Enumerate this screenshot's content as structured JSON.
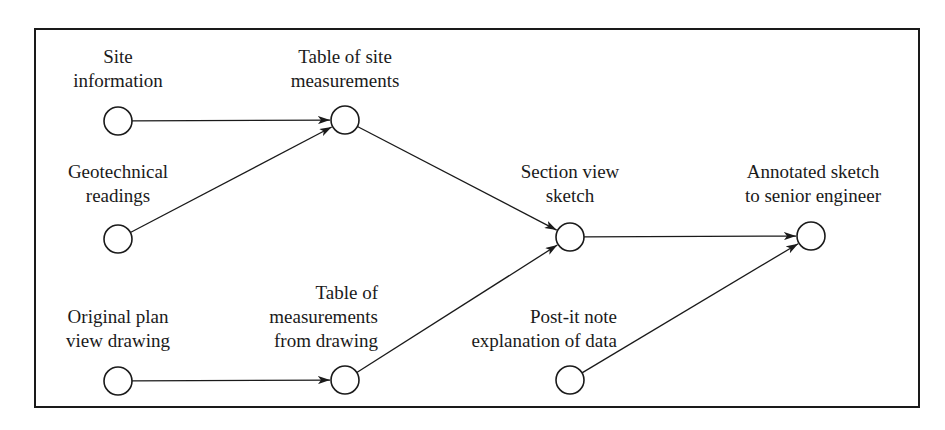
{
  "diagram": {
    "colors": {
      "stroke": "#1a1a1a",
      "background": "#ffffff"
    },
    "nodes": [
      {
        "id": "site_information",
        "label": [
          "Site",
          "information"
        ],
        "cx": 118,
        "cy": 121
      },
      {
        "id": "geotechnical_readings",
        "label": [
          "Geotechnical",
          "readings"
        ],
        "cx": 118,
        "cy": 239
      },
      {
        "id": "original_plan_view_drawing",
        "label": [
          "Original plan",
          "view drawing"
        ],
        "cx": 118,
        "cy": 381
      },
      {
        "id": "table_of_site_measurements",
        "label": [
          "Table of site",
          "measurements"
        ],
        "cx": 345,
        "cy": 120
      },
      {
        "id": "table_of_measurements_from_drawing",
        "label": [
          "Table of",
          "measurements",
          "from drawing"
        ],
        "cx": 345,
        "cy": 380
      },
      {
        "id": "section_view_sketch",
        "label": [
          "Section view",
          "sketch"
        ],
        "cx": 570,
        "cy": 237
      },
      {
        "id": "post_it_note",
        "label": [
          "Post-it note",
          "explanation of data"
        ],
        "cx": 570,
        "cy": 380
      },
      {
        "id": "annotated_sketch",
        "label": [
          "Annotated sketch",
          "to senior engineer"
        ],
        "cx": 811,
        "cy": 236
      }
    ],
    "edges": [
      {
        "from": "site_information",
        "to": "table_of_site_measurements"
      },
      {
        "from": "geotechnical_readings",
        "to": "table_of_site_measurements"
      },
      {
        "from": "table_of_site_measurements",
        "to": "section_view_sketch"
      },
      {
        "from": "original_plan_view_drawing",
        "to": "table_of_measurements_from_drawing"
      },
      {
        "from": "table_of_measurements_from_drawing",
        "to": "section_view_sketch"
      },
      {
        "from": "section_view_sketch",
        "to": "annotated_sketch"
      },
      {
        "from": "post_it_note",
        "to": "annotated_sketch"
      }
    ]
  }
}
